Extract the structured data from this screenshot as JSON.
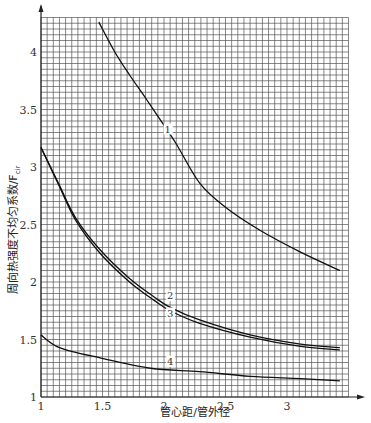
{
  "chart_data": {
    "type": "line",
    "title": "",
    "xlabel": "管心距/管外径",
    "ylabel": "周向热强度不均匀系数/F",
    "ylabel_subscript": "cir",
    "xlim": [
      1,
      3.5
    ],
    "ylim": [
      1,
      4.3
    ],
    "xticks": [
      1,
      1.5,
      2,
      2.5,
      3
    ],
    "xtick_labels": [
      "1",
      "1.5",
      "2",
      "2.5",
      "3"
    ],
    "yticks": [
      1,
      1.5,
      2,
      2.5,
      3,
      3.5,
      4
    ],
    "ytick_labels": [
      "1",
      "1.5",
      "2",
      "2.5",
      "3",
      "3.5",
      "4"
    ],
    "grid": true,
    "grid_minor_x": 0.05,
    "grid_minor_y": 0.05,
    "legend": "inline labels on curves",
    "series": [
      {
        "name": "1",
        "x": [
          1.47,
          1.6,
          1.72,
          1.85,
          1.97,
          2.1,
          2.29,
          2.5,
          2.78,
          3.11,
          3.43
        ],
        "y": [
          4.26,
          4.0,
          3.8,
          3.6,
          3.41,
          3.2,
          2.86,
          2.65,
          2.45,
          2.26,
          2.1
        ]
      },
      {
        "name": "2",
        "x": [
          1.0,
          1.15,
          1.28,
          1.48,
          1.72,
          1.92,
          2.05,
          2.29,
          2.7,
          3.11,
          3.43
        ],
        "y": [
          3.17,
          2.84,
          2.56,
          2.28,
          2.03,
          1.87,
          1.78,
          1.67,
          1.54,
          1.46,
          1.43
        ]
      },
      {
        "name": "3",
        "x": [
          1.0,
          1.15,
          1.28,
          1.48,
          1.72,
          1.92,
          2.05,
          2.29,
          2.7,
          3.11,
          3.43
        ],
        "y": [
          3.17,
          2.83,
          2.54,
          2.25,
          2.0,
          1.84,
          1.75,
          1.64,
          1.52,
          1.44,
          1.41
        ]
      },
      {
        "name": "4",
        "x": [
          1.0,
          1.15,
          1.48,
          1.89,
          2.29,
          2.7,
          3.11,
          3.43
        ],
        "y": [
          1.54,
          1.43,
          1.34,
          1.25,
          1.22,
          1.18,
          1.16,
          1.14
        ]
      }
    ],
    "annotations": [
      {
        "text": "1",
        "x": 2.03,
        "y": 3.3
      },
      {
        "text": "2",
        "x": 2.05,
        "y": 1.85
      },
      {
        "text": "3",
        "x": 2.05,
        "y": 1.7
      },
      {
        "text": "4",
        "x": 2.05,
        "y": 1.28
      }
    ]
  },
  "axes": {
    "x_title": "管心距/管外径",
    "y_title": "周向热强度不均匀系数/F",
    "y_title_sub": "cir"
  }
}
